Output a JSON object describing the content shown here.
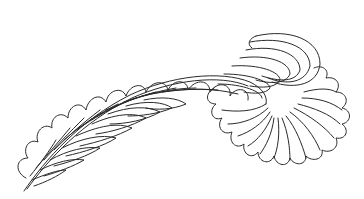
{
  "image": {
    "subject": "fern frond line drawing",
    "background": "#ffffff",
    "stroke_color": "#2a2a2a"
  }
}
